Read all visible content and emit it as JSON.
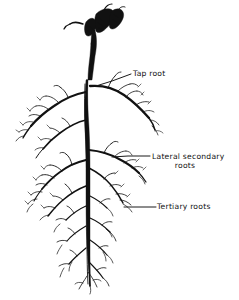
{
  "figure": {
    "kind": "botanical-line-drawing",
    "background_color": "#ffffff",
    "ink_color": "#111111"
  },
  "callouts": [
    {
      "id": "tap-root",
      "label": "Tap root",
      "label_x": 133,
      "label_y": 76,
      "leader": "M96,86 L112,81 L131,74"
    },
    {
      "id": "lateral-secondary-roots",
      "label_line1": "Lateral secondary",
      "label_line2": "roots",
      "line1_x": 152,
      "line1_y": 159,
      "line2_x": 185,
      "line2_y": 168,
      "leader": "M112,157 L128,156 L150,156"
    },
    {
      "id": "tertiary-roots",
      "label": "Tertiary roots",
      "label_x": 157,
      "label_y": 209,
      "leader": "M124,207 L140,207 L156,207"
    }
  ],
  "anatomy": {
    "crown_label": "stem crown with buds",
    "taproot_label": "primary vertical taproot",
    "lateral_label": "lateral secondary roots",
    "tertiary_label": "fine tertiary roots"
  }
}
